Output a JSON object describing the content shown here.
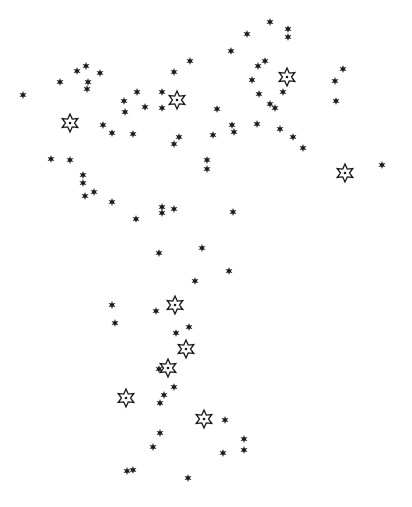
{
  "chart_data": {
    "type": "scatter",
    "title": "",
    "width": 412,
    "height": 507,
    "colors": {
      "ink": "#1a1a1a",
      "background": "#ffffff"
    },
    "legend": [],
    "series": [
      {
        "name": "filled-stars",
        "glyph": "solid six-pointed star",
        "size": 7,
        "points": [
          [
            23,
            95
          ],
          [
            60,
            82
          ],
          [
            77,
            71
          ],
          [
            86,
            66
          ],
          [
            100,
            73
          ],
          [
            88,
            82
          ],
          [
            87,
            89
          ],
          [
            103,
            125
          ],
          [
            112,
            133
          ],
          [
            133,
            134
          ],
          [
            125,
            112
          ],
          [
            124,
            101
          ],
          [
            145,
            107
          ],
          [
            137,
            92
          ],
          [
            162,
            92
          ],
          [
            162,
            108
          ],
          [
            174,
            72
          ],
          [
            190,
            61
          ],
          [
            270,
            22
          ],
          [
            288,
            29
          ],
          [
            288,
            37
          ],
          [
            247,
            34
          ],
          [
            231,
            51
          ],
          [
            258,
            66
          ],
          [
            265,
            61
          ],
          [
            252,
            80
          ],
          [
            259,
            94
          ],
          [
            283,
            92
          ],
          [
            270,
            104
          ],
          [
            275,
            108
          ],
          [
            343,
            69
          ],
          [
            335,
            81
          ],
          [
            336,
            101
          ],
          [
            382,
            165
          ],
          [
            217,
            109
          ],
          [
            213,
            135
          ],
          [
            232,
            125
          ],
          [
            234,
            132
          ],
          [
            257,
            124
          ],
          [
            280,
            129
          ],
          [
            293,
            137
          ],
          [
            303,
            148
          ],
          [
            207,
            160
          ],
          [
            207,
            169
          ],
          [
            179,
            137
          ],
          [
            174,
            144
          ],
          [
            51,
            159
          ],
          [
            70,
            160
          ],
          [
            83,
            175
          ],
          [
            83,
            183
          ],
          [
            85,
            196
          ],
          [
            94,
            192
          ],
          [
            112,
            202
          ],
          [
            136,
            219
          ],
          [
            162,
            207
          ],
          [
            162,
            213
          ],
          [
            174,
            209
          ],
          [
            233,
            212
          ],
          [
            159,
            253
          ],
          [
            202,
            248
          ],
          [
            229,
            271
          ],
          [
            195,
            281
          ],
          [
            112,
            305
          ],
          [
            115,
            323
          ],
          [
            156,
            311
          ],
          [
            189,
            327
          ],
          [
            176,
            333
          ],
          [
            159,
            369
          ],
          [
            174,
            387
          ],
          [
            164,
            395
          ],
          [
            160,
            403
          ],
          [
            160,
            433
          ],
          [
            225,
            420
          ],
          [
            244,
            439
          ],
          [
            244,
            450
          ],
          [
            223,
            453
          ],
          [
            153,
            447
          ],
          [
            127,
            471
          ],
          [
            133,
            470
          ],
          [
            188,
            478
          ]
        ]
      },
      {
        "name": "outlined-stars",
        "glyph": "outlined six-pointed star with center dot",
        "size": 18,
        "points": [
          [
            70,
            123
          ],
          [
            177,
            100
          ],
          [
            287,
            77
          ],
          [
            345,
            173
          ],
          [
            175,
            305
          ],
          [
            186,
            349
          ],
          [
            168,
            368
          ],
          [
            126,
            398
          ],
          [
            204,
            419
          ]
        ]
      }
    ]
  }
}
